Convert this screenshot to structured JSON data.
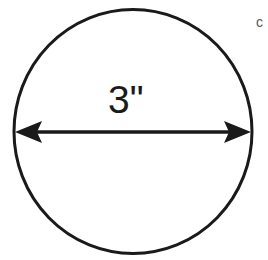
{
  "diagram": {
    "shape": "circle",
    "dimension_label": "3\"",
    "dimension_type": "diameter",
    "corner_mark": "c",
    "colors": {
      "stroke": "#1a1a1a",
      "background": "#ffffff",
      "corner_mark": "#555555"
    }
  }
}
